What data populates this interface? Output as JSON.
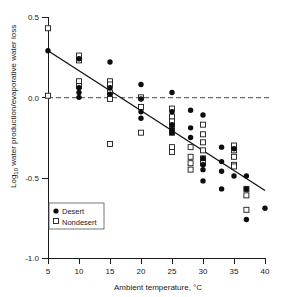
{
  "chart_data": {
    "type": "scatter",
    "title": "",
    "xlabel": "Ambient temperature, °C",
    "ylabel_main": "Log",
    "ylabel_sub": "10",
    "ylabel_rest": " water production/evaporative water loss",
    "xlim": [
      5,
      40
    ],
    "ylim": [
      -1.0,
      0.5
    ],
    "xticks": [
      5,
      10,
      15,
      20,
      25,
      30,
      35,
      40
    ],
    "xticklabels": [
      "5",
      "10",
      "15",
      "20",
      "25",
      "30",
      "35",
      "40"
    ],
    "yticks": [
      0.5,
      0.0,
      -0.5,
      -1.0
    ],
    "yticklabels": [
      "0.5",
      "0.0",
      "-0.5",
      "-1.0"
    ],
    "grid": false,
    "reference_line": {
      "type": "horizontal",
      "y": 0.0,
      "style": "dashed"
    },
    "regression_line": {
      "x0": 5,
      "y0": 0.29,
      "x1": 40,
      "y1": -0.58
    },
    "legend": {
      "position": "bottom-left-inside",
      "entries": [
        {
          "label": "Desert",
          "marker": "filled-circle"
        },
        {
          "label": "Nondesert",
          "marker": "open-square"
        }
      ]
    },
    "series": [
      {
        "name": "Desert",
        "marker": "filled-circle",
        "points": [
          [
            5,
            0.29
          ],
          [
            10,
            0.24
          ],
          [
            10,
            0.06
          ],
          [
            10,
            0.03
          ],
          [
            10,
            0.0
          ],
          [
            15,
            0.22
          ],
          [
            15,
            0.06
          ],
          [
            15,
            0.02
          ],
          [
            20,
            0.08
          ],
          [
            20,
            -0.01
          ],
          [
            20,
            -0.09
          ],
          [
            20,
            -0.13
          ],
          [
            25,
            0.03
          ],
          [
            25,
            -0.09
          ],
          [
            25,
            -0.17
          ],
          [
            25,
            -0.2
          ],
          [
            25,
            -0.22
          ],
          [
            28,
            -0.08
          ],
          [
            28,
            -0.19
          ],
          [
            28,
            -0.25
          ],
          [
            30,
            -0.11
          ],
          [
            30,
            -0.38
          ],
          [
            30,
            -0.42
          ],
          [
            30,
            -0.45
          ],
          [
            30,
            -0.52
          ],
          [
            33,
            -0.31
          ],
          [
            33,
            -0.4
          ],
          [
            33,
            -0.46
          ],
          [
            33,
            -0.57
          ],
          [
            35,
            -0.32
          ],
          [
            35,
            -0.49
          ],
          [
            37,
            -0.49
          ],
          [
            37,
            -0.57
          ],
          [
            37,
            -0.76
          ],
          [
            40,
            -0.69
          ]
        ]
      },
      {
        "name": "Nondesert",
        "marker": "open-square",
        "points": [
          [
            5,
            0.43
          ],
          [
            5,
            0.01
          ],
          [
            10,
            0.26
          ],
          [
            10,
            0.23
          ],
          [
            10,
            0.1
          ],
          [
            10,
            0.07
          ],
          [
            15,
            0.1
          ],
          [
            15,
            0.08
          ],
          [
            15,
            0.03
          ],
          [
            15,
            -0.01
          ],
          [
            15,
            -0.29
          ],
          [
            20,
            0.0
          ],
          [
            20,
            -0.06
          ],
          [
            20,
            -0.22
          ],
          [
            25,
            -0.07
          ],
          [
            25,
            -0.12
          ],
          [
            25,
            -0.15
          ],
          [
            25,
            -0.18
          ],
          [
            25,
            -0.22
          ],
          [
            25,
            -0.31
          ],
          [
            25,
            -0.34
          ],
          [
            28,
            -0.31
          ],
          [
            28,
            -0.37
          ],
          [
            28,
            -0.41
          ],
          [
            28,
            -0.45
          ],
          [
            30,
            -0.17
          ],
          [
            30,
            -0.23
          ],
          [
            30,
            -0.28
          ],
          [
            30,
            -0.33
          ],
          [
            30,
            -0.38
          ],
          [
            30,
            -0.41
          ],
          [
            35,
            -0.3
          ],
          [
            35,
            -0.33
          ],
          [
            35,
            -0.37
          ],
          [
            35,
            -0.42
          ],
          [
            35,
            -0.43
          ],
          [
            37,
            -0.57
          ],
          [
            37,
            -0.61
          ],
          [
            37,
            -0.7
          ]
        ]
      }
    ]
  },
  "axes": {
    "x_title": "Ambient temperature, °C",
    "y_title_prefix": "Log",
    "y_title_subscript": "10",
    "y_title_suffix": " water production/evaporative water loss"
  },
  "colors": {
    "desert_marker": "#0d0d0d",
    "nondesert_marker": "#ffffff",
    "nondesert_stroke": "#1a1a1a",
    "axis": "#1a1a1a",
    "zero_line": "#4d4d4d",
    "fit_line": "#111111",
    "background": "#ffffff"
  }
}
